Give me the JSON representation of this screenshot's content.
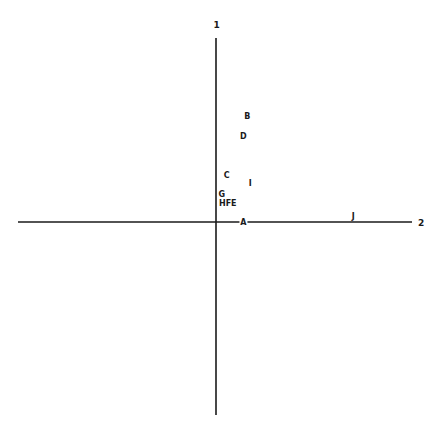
{
  "chart_data": {
    "type": "scatter",
    "title": "",
    "xlabel": "2",
    "ylabel": "1",
    "xlim": [
      -2.0,
      2.0
    ],
    "ylim": [
      -2.0,
      2.0
    ],
    "grid": false,
    "legend": "none",
    "points": [
      {
        "label": "B",
        "x": 0.32,
        "y": 1.15
      },
      {
        "label": "D",
        "x": 0.28,
        "y": 0.93
      },
      {
        "label": "C",
        "x": 0.11,
        "y": 0.51
      },
      {
        "label": "I",
        "x": 0.35,
        "y": 0.42
      },
      {
        "label": "G",
        "x": 0.06,
        "y": 0.3
      },
      {
        "label": "HFE",
        "x": 0.12,
        "y": 0.21
      },
      {
        "label": "A",
        "x": 0.28,
        "y": 0.0
      },
      {
        "label": "J",
        "x": 1.4,
        "y": 0.06
      }
    ]
  }
}
